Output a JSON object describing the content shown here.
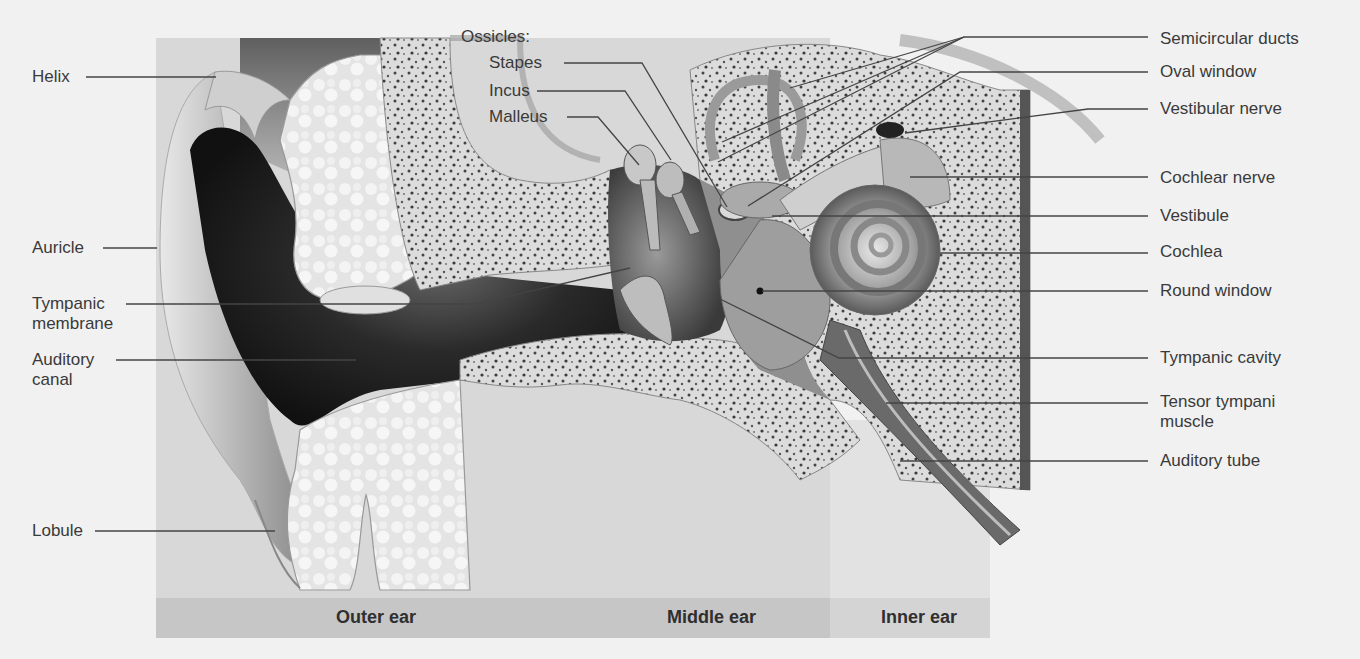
{
  "figure": {
    "group_heading": "Ossicles:",
    "regions": [
      {
        "id": "outer",
        "label": "Outer ear"
      },
      {
        "id": "middle",
        "label": "Middle ear"
      },
      {
        "id": "inner",
        "label": "Inner ear"
      }
    ],
    "left_labels": [
      {
        "id": "helix",
        "text": "Helix"
      },
      {
        "id": "auricle",
        "text": "Auricle"
      },
      {
        "id": "tympanic-membrane",
        "line1": "Tympanic",
        "line2": "membrane"
      },
      {
        "id": "auditory-canal",
        "line1": "Auditory",
        "line2": "canal"
      },
      {
        "id": "lobule",
        "text": "Lobule"
      }
    ],
    "ossicle_labels": [
      {
        "id": "stapes",
        "text": "Stapes"
      },
      {
        "id": "incus",
        "text": "Incus"
      },
      {
        "id": "malleus",
        "text": "Malleus"
      }
    ],
    "right_labels": [
      {
        "id": "semicircular-ducts",
        "text": "Semicircular ducts"
      },
      {
        "id": "oval-window",
        "text": "Oval window"
      },
      {
        "id": "vestibular-nerve",
        "text": "Vestibular nerve"
      },
      {
        "id": "cochlear-nerve",
        "text": "Cochlear nerve"
      },
      {
        "id": "vestibule",
        "text": "Vestibule"
      },
      {
        "id": "cochlea",
        "text": "Cochlea"
      },
      {
        "id": "round-window",
        "text": "Round window"
      },
      {
        "id": "tympanic-cavity",
        "text": "Tympanic cavity"
      },
      {
        "id": "tensor-tympani",
        "line1": "Tensor tympani",
        "line2": "muscle"
      },
      {
        "id": "auditory-tube",
        "text": "Auditory tube"
      }
    ],
    "colors": {
      "background": "#f1f1f1",
      "panel": "#d9d9d9",
      "region_band": "#c4c4c4",
      "inner_band": "#d4d4d4",
      "leader_line": "#444444",
      "bone": "#dcdcdc",
      "canal_dark": "#1e1e1e"
    }
  }
}
